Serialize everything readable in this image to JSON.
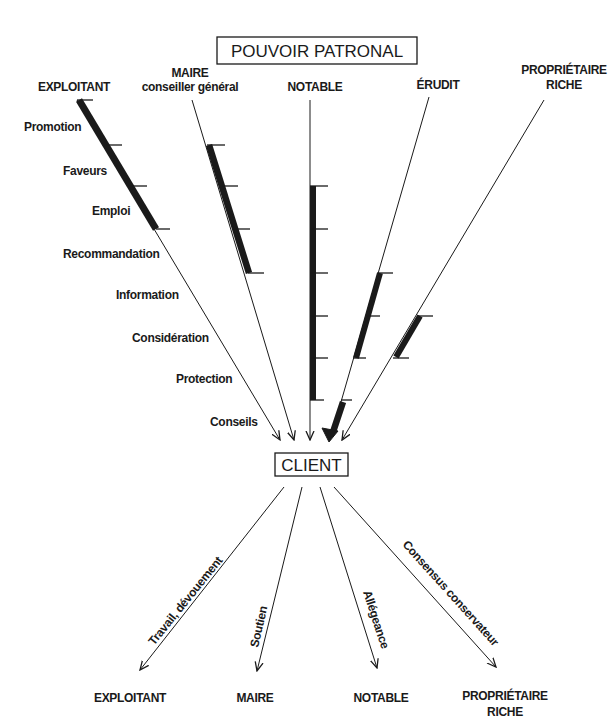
{
  "title": "POUVOIR PATRONAL",
  "center": "CLIENT",
  "patrons": [
    {
      "line1": "EXPLOITANT",
      "line2": ""
    },
    {
      "line1": "MAIRE",
      "line2": "conseiller général"
    },
    {
      "line1": "NOTABLE",
      "line2": ""
    },
    {
      "line1": "ÉRUDIT",
      "line2": ""
    },
    {
      "line1": "PROPRIÉTAIRE",
      "line2": "RICHE"
    }
  ],
  "resources": [
    "Promotion",
    "Faveurs",
    "Emploi",
    "Recommandation",
    "Information",
    "Considération",
    "Protection",
    "Conseils"
  ],
  "thick_segments_description": {
    "EXPLOITANT": [
      "Promotion",
      "Faveurs",
      "Emploi"
    ],
    "MAIRE": [
      "Faveurs",
      "Emploi",
      "Recommandation"
    ],
    "NOTABLE": [
      "Emploi",
      "Recommandation",
      "Information",
      "Considération",
      "Protection"
    ],
    "ÉRUDIT": [
      "Information",
      "Considération",
      "Conseils"
    ],
    "PROPRIÉTAIRE RICHE": [
      "Considération"
    ]
  },
  "returns": [
    {
      "flow": "Travail, dévouement",
      "target_line1": "EXPLOITANT",
      "target_line2": ""
    },
    {
      "flow": "Soutien",
      "target_line1": "MAIRE",
      "target_line2": ""
    },
    {
      "flow": "Allégeance",
      "target_line1": "NOTABLE",
      "target_line2": ""
    },
    {
      "flow": "Consensus conservateur",
      "target_line1": "PROPRIÉTAIRE",
      "target_line2": "RICHE"
    }
  ],
  "colors": {
    "ink": "#1a1a1a",
    "background": "#ffffff"
  }
}
